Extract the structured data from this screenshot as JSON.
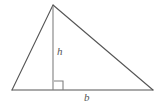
{
  "figure": {
    "kind": "geometry-diagram",
    "shape": "triangle",
    "background_color": "#ffffff",
    "stroke_color": "#555555",
    "altitude_stroke_color": "#777777",
    "label_color": "#555555"
  },
  "labels": {
    "height": "h",
    "base": "b"
  },
  "geometry": {
    "apex": {
      "x": 53,
      "y": 5
    },
    "left_vertex": {
      "x": 12,
      "y": 90
    },
    "right_vertex": {
      "x": 153,
      "y": 90
    },
    "foot_of_altitude": {
      "x": 53,
      "y": 90
    },
    "right_angle_marker": {
      "x": 54,
      "y": 81,
      "size": 9
    }
  }
}
